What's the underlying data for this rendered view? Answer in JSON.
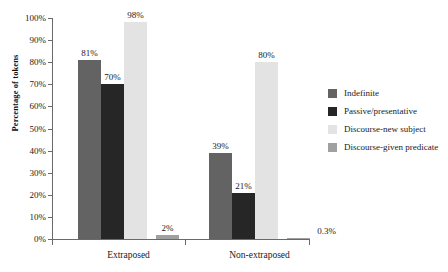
{
  "chart_data": {
    "type": "bar",
    "title": "",
    "xlabel": "",
    "ylabel": "Percentage of tokens",
    "ylim": [
      0,
      100
    ],
    "grid": false,
    "legend_position": "right",
    "categories": [
      "Extraposed",
      "Non-extraposed"
    ],
    "tick_labels": [
      "0%",
      "10%",
      "20%",
      "30%",
      "40%",
      "50%",
      "60%",
      "70%",
      "80%",
      "90%",
      "100%"
    ],
    "tick_values": [
      0,
      10,
      20,
      30,
      40,
      50,
      60,
      70,
      80,
      90,
      100
    ],
    "series": [
      {
        "name": "Indefinite",
        "color": "#636363",
        "values": [
          81,
          39
        ],
        "labels": [
          "81%",
          "39%"
        ]
      },
      {
        "name": "Passive/presentative",
        "color": "#262626",
        "values": [
          70,
          21
        ],
        "labels": [
          "70%",
          "21%"
        ]
      },
      {
        "name": "Discourse-new subject",
        "color": "#e3e3e3",
        "values": [
          98,
          80
        ],
        "labels": [
          "98%",
          "80%"
        ]
      },
      {
        "name": "Discourse-given predicate",
        "color": "#a0a0a0",
        "values": [
          2,
          0.3
        ],
        "labels": [
          "2%",
          "0.3%"
        ]
      }
    ]
  },
  "legend": {
    "items": [
      {
        "label": "Indefinite",
        "color": "#636363"
      },
      {
        "label": "Passive/presentative",
        "color": "#262626"
      },
      {
        "label": "Discourse-new subject",
        "color": "#e3e3e3"
      },
      {
        "label": "Discourse-given predicate",
        "color": "#a0a0a0"
      }
    ]
  }
}
